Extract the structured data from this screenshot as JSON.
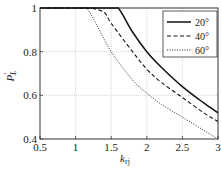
{
  "chart_data": {
    "type": "line",
    "title": "",
    "xlabel": "k_rj",
    "ylabel": "P'_L",
    "xlim": [
      0.5,
      3
    ],
    "ylim": [
      0.4,
      1
    ],
    "xticks": [
      0.5,
      1,
      1.5,
      2,
      2.5,
      3
    ],
    "xtick_labels": [
      "0.5",
      "1",
      "1.5",
      "2",
      "2.5",
      "3"
    ],
    "yticks": [
      0.4,
      0.6,
      0.8,
      1
    ],
    "ytick_labels": [
      "0.4",
      "0.6",
      "0.8",
      "1"
    ],
    "grid": true,
    "legend_position": "upper right",
    "series": [
      {
        "name": "20°",
        "style": "solid",
        "x": [
          0.5,
          1.0,
          1.5,
          1.6,
          1.8,
          2.0,
          2.2,
          2.5,
          2.8,
          3.0
        ],
        "y": [
          1.0,
          1.0,
          1.0,
          1.0,
          0.89,
          0.8,
          0.73,
          0.64,
          0.565,
          0.52
        ]
      },
      {
        "name": "40°",
        "style": "dashed",
        "x": [
          0.5,
          1.0,
          1.2,
          1.4,
          1.5,
          1.8,
          2.0,
          2.2,
          2.5,
          2.8,
          3.0
        ],
        "y": [
          1.0,
          1.0,
          1.0,
          0.98,
          0.93,
          0.8,
          0.72,
          0.66,
          0.59,
          0.52,
          0.48
        ]
      },
      {
        "name": "60°",
        "style": "dotted",
        "x": [
          0.5,
          1.0,
          1.15,
          1.3,
          1.5,
          1.8,
          2.0,
          2.2,
          2.5,
          2.8,
          3.0
        ],
        "y": [
          1.0,
          1.0,
          1.0,
          0.92,
          0.8,
          0.67,
          0.61,
          0.56,
          0.5,
          0.44,
          0.4
        ]
      }
    ]
  },
  "labels": {
    "xlabel_main": "k",
    "xlabel_sub": "rj",
    "ylabel_main": "P",
    "ylabel_sup": "′",
    "ylabel_sub": "L"
  },
  "legend": [
    {
      "label": "20°",
      "style": "solid"
    },
    {
      "label": "40°",
      "style": "dashed"
    },
    {
      "label": "60°",
      "style": "dotted"
    }
  ],
  "colors": {
    "line": "#111111",
    "grid": "#b8b8b8",
    "axis": "#333333"
  }
}
